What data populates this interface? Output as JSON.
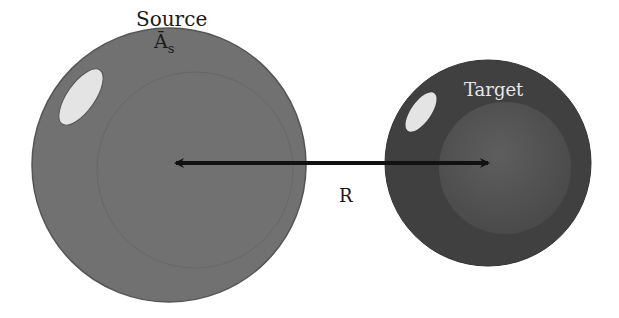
{
  "diagram": {
    "source": {
      "label": "Source",
      "symbol": "Ā",
      "symbol_subscript": "s",
      "color": "#707070",
      "edge_color": "#555555",
      "highlight_color": "#e4e4e4"
    },
    "target": {
      "label": "Target",
      "color": "#404040",
      "inner_color": "#555555",
      "highlight_color": "#e4e4e4"
    },
    "distance": {
      "label": "R",
      "arrow_color": "#111111"
    }
  }
}
